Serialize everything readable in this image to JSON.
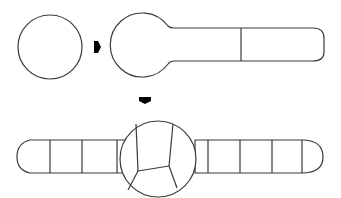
{
  "diagram": {
    "type": "process-sequence",
    "stroke_color": "#3a3a3a",
    "arrow_color": "#000000",
    "background": "#ffffff",
    "stages": [
      {
        "id": "stage-1",
        "description": "Single round cell (sphere)",
        "segments": 0
      },
      {
        "id": "stage-2",
        "description": "Round body with elongated tubular extension divided into 2 segments",
        "segments": 2
      },
      {
        "id": "stage-3",
        "description": "Central subdivided round body with tubular extensions on both sides, left arm 3 segments, right arm 5 segments",
        "left_segments": 3,
        "right_segments": 5,
        "center_subdivisions": 5
      }
    ],
    "arrows": [
      {
        "id": "arrow-right",
        "direction": "right",
        "from": "stage-1",
        "to": "stage-2"
      },
      {
        "id": "arrow-down",
        "direction": "down",
        "from": "stage-2",
        "to": "stage-3"
      }
    ]
  }
}
